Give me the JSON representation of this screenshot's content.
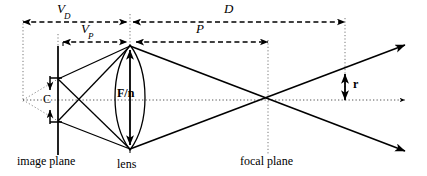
{
  "figure": {
    "type": "optics-ray-diagram",
    "background_color": "#ffffff",
    "stroke_color": "#000000",
    "width": 427,
    "height": 176
  },
  "dimensions": [
    {
      "id": "vd",
      "label": "V",
      "subscript": "D",
      "style": "dashed",
      "label_x": 64,
      "label_y": 8,
      "from_x": 23,
      "to_x": 127,
      "y": 22
    },
    {
      "id": "d",
      "label": "D",
      "subscript": "",
      "style": "dashed",
      "label_x": 225,
      "label_y": 7,
      "from_x": 131,
      "to_x": 345,
      "y": 22
    },
    {
      "id": "vp",
      "label": "V",
      "subscript": "P",
      "style": "dashed",
      "label_x": 80,
      "label_y": 26,
      "from_x": 63,
      "to_x": 127,
      "y": 42
    },
    {
      "id": "p",
      "label": "P",
      "subscript": "",
      "style": "dashed",
      "label_x": 195,
      "label_y": 26,
      "from_x": 134,
      "to_x": 268,
      "y": 42
    }
  ],
  "measures": [
    {
      "id": "c",
      "label": "C",
      "label_x": 44,
      "label_y": 93,
      "description": "circle of confusion at image plane"
    },
    {
      "id": "f_over_n",
      "label": "F/n",
      "label_x": 116,
      "label_y": 87,
      "description": "lens aperture diameter"
    },
    {
      "id": "r",
      "label": "r",
      "label_x": 352,
      "label_y": 80,
      "description": "blur radius beyond focal plane"
    }
  ],
  "plane_labels": [
    {
      "id": "image-plane",
      "label": "image plane",
      "x": 18,
      "y": 158
    },
    {
      "id": "lens",
      "label": "lens",
      "x": 117,
      "y": 161
    },
    {
      "id": "focal-plane",
      "label": "focal plane",
      "x": 240,
      "y": 158
    }
  ],
  "geometry": {
    "axis_y": 100,
    "image_plane_x": 58,
    "lens_x": 130,
    "lens_top_y": 45,
    "lens_bottom_y": 150,
    "focal_plane_x": 268,
    "far_plane_x": 345,
    "virtual_origin_x": 23,
    "c_top_y": 78,
    "c_bottom_y": 122,
    "right_edge_x": 412,
    "upper_ray_right_y": 47,
    "lower_ray_right_y": 150,
    "r_top_y": 75
  }
}
